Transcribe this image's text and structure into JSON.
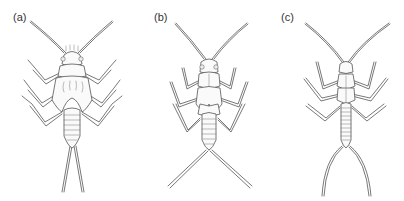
{
  "figure": {
    "panels": [
      {
        "label": "(a)",
        "subject": "stonefly nymph, broad-bodied with wing pads and short straight cerci"
      },
      {
        "label": "(b)",
        "subject": "stonefly nymph, slender legs with widely spread straight cerci"
      },
      {
        "label": "(c)",
        "subject": "stonefly nymph, elongate slender body with long curved cerci"
      }
    ],
    "colors": {
      "line": "#555555",
      "background": "#ffffff"
    }
  }
}
